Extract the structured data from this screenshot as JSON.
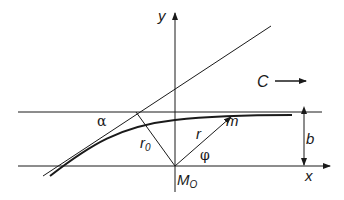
{
  "diagram": {
    "labels": {
      "y_axis": "y",
      "x_axis": "x",
      "velocity": "C",
      "alpha": "α",
      "r0": "r",
      "r0_sub": "0",
      "r": "r",
      "phi": "φ",
      "m": "m",
      "b": "b",
      "origin": "M",
      "origin_sub": "O"
    },
    "colors": {
      "line": "#1a1a1a",
      "background": "#ffffff"
    }
  }
}
